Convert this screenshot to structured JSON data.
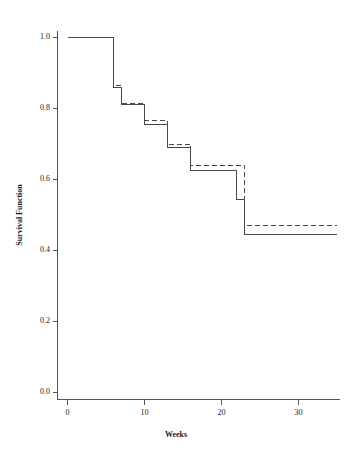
{
  "chart_data": {
    "type": "line",
    "title": "",
    "xlabel": "Weeks",
    "ylabel": "Survival Function",
    "xlim": [
      -1.5,
      35.5
    ],
    "ylim": [
      0.0,
      1.04
    ],
    "xticks": [
      0,
      10,
      20,
      30
    ],
    "xtick_labels": [
      "0",
      "10",
      "20",
      "30"
    ],
    "yticks": [
      0.0,
      0.2,
      0.4,
      0.6,
      0.8,
      1.0
    ],
    "ytick_labels": [
      "0.0",
      "0.2",
      "0.4",
      "0.6",
      "0.8",
      "1.0"
    ],
    "grid": false,
    "legend": "none",
    "step_shape": "post",
    "series": [
      {
        "name": "survival-solid",
        "style": "solid",
        "color": "#4a4a4a",
        "x": [
          0,
          6,
          7,
          10,
          13,
          16,
          22,
          23,
          35
        ],
        "values": [
          1.0,
          0.86,
          0.81,
          0.755,
          0.69,
          0.625,
          0.545,
          0.445,
          0.445
        ]
      },
      {
        "name": "survival-dashed",
        "style": "dashed",
        "color": "#4a4a4a",
        "x": [
          0,
          6,
          7,
          10,
          13,
          16,
          22,
          23,
          35
        ],
        "values": [
          1.0,
          0.865,
          0.815,
          0.765,
          0.7,
          0.64,
          0.64,
          0.47,
          0.47
        ]
      }
    ]
  },
  "axes": {
    "y_title": "Survival Function",
    "x_title": "Weeks"
  }
}
